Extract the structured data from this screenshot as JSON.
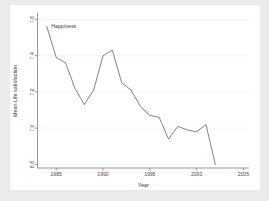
{
  "chart_data": {
    "type": "line",
    "title": "",
    "xlabel": "Year",
    "ylabel": "Mean Life satisfaction",
    "xlim": [
      1983,
      2005.6
    ],
    "ylim": [
      6.78,
      7.63
    ],
    "grid": true,
    "legend_position": "inline-top-left",
    "xticks": [
      1985,
      1990,
      1995,
      2000,
      2005
    ],
    "xtick_labels": [
      "1985",
      "1990",
      "1995",
      "2000",
      "2005"
    ],
    "yticks": [
      6.8,
      7.0,
      7.2,
      7.4,
      7.6
    ],
    "ytick_labels": [
      "6.8",
      "7.0",
      "7.2",
      "7.4",
      "7.6"
    ],
    "series": [
      {
        "name": "Happiness",
        "color": "#5a5a5a",
        "x": [
          1984,
          1985,
          1986,
          1987,
          1988,
          1989,
          1990,
          1991,
          1992,
          1993,
          1994,
          1995,
          1996,
          1997,
          1998,
          1999,
          2000,
          2001,
          2002
        ],
        "values": [
          7.56,
          7.39,
          7.36,
          7.22,
          7.13,
          7.21,
          7.4,
          7.43,
          7.25,
          7.21,
          7.12,
          7.07,
          7.06,
          6.94,
          7.01,
          6.99,
          6.98,
          7.02,
          6.8
        ]
      }
    ],
    "annotations": [
      {
        "text": "Happiness",
        "x": 1984.3,
        "y": 7.56
      }
    ]
  },
  "axis": {
    "x_title": "Year",
    "y_title": "Mean Life satisfaction"
  },
  "colors": {
    "figure_background": "#ebebeb",
    "plot_background": "#ffffff",
    "line": "#5a5a5a",
    "axis": "#6f6f6f",
    "grid": "#f2f2f2",
    "text": "#3c3c3c"
  }
}
